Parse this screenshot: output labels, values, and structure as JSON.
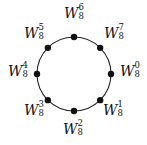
{
  "diagram": {
    "type": "roots-of-unity-circle",
    "circle": {
      "cx": 74,
      "cy": 74,
      "r": 37,
      "stroke": "#222222"
    },
    "points": [
      {
        "label_base": "W",
        "sub": "8",
        "sup": "0",
        "angle_deg": 0,
        "label_x": 120,
        "label_y": 64
      },
      {
        "label_base": "W",
        "sub": "8",
        "sup": "1",
        "angle_deg": 45,
        "label_x": 103,
        "label_y": 103
      },
      {
        "label_base": "W",
        "sub": "8",
        "sup": "2",
        "angle_deg": 90,
        "label_x": 63,
        "label_y": 122
      },
      {
        "label_base": "W",
        "sub": "8",
        "sup": "3",
        "angle_deg": 135,
        "label_x": 24,
        "label_y": 103
      },
      {
        "label_base": "W",
        "sub": "8",
        "sup": "4",
        "angle_deg": 180,
        "label_x": 8,
        "label_y": 64
      },
      {
        "label_base": "W",
        "sub": "8",
        "sup": "5",
        "angle_deg": 225,
        "label_x": 24,
        "label_y": 26
      },
      {
        "label_base": "W",
        "sub": "8",
        "sup": "6",
        "angle_deg": 270,
        "label_x": 64,
        "label_y": 6
      },
      {
        "label_base": "W",
        "sub": "8",
        "sup": "7",
        "angle_deg": 315,
        "label_x": 104,
        "label_y": 26
      }
    ]
  }
}
